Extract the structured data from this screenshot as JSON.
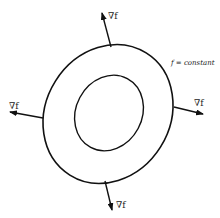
{
  "diagram": {
    "level_label": "f = constant",
    "gradient_label": "∇f",
    "colors": {
      "stroke": "#111111",
      "background": "#ffffff",
      "text": "#222222"
    },
    "curves": [
      {
        "name": "outer-level-curve",
        "cx": 108,
        "cy": 114,
        "rx": 64,
        "ry": 71,
        "rotate": 30
      },
      {
        "name": "inner-level-curve",
        "cx": 109,
        "cy": 113,
        "rx": 34,
        "ry": 38,
        "rotate": 25
      }
    ],
    "arrows": [
      {
        "name": "gradient-arrow-top",
        "label": "∇f"
      },
      {
        "name": "gradient-arrow-right",
        "label": "∇f"
      },
      {
        "name": "gradient-arrow-left",
        "label": "∇f"
      },
      {
        "name": "gradient-arrow-bottom",
        "label": "∇f"
      }
    ]
  }
}
